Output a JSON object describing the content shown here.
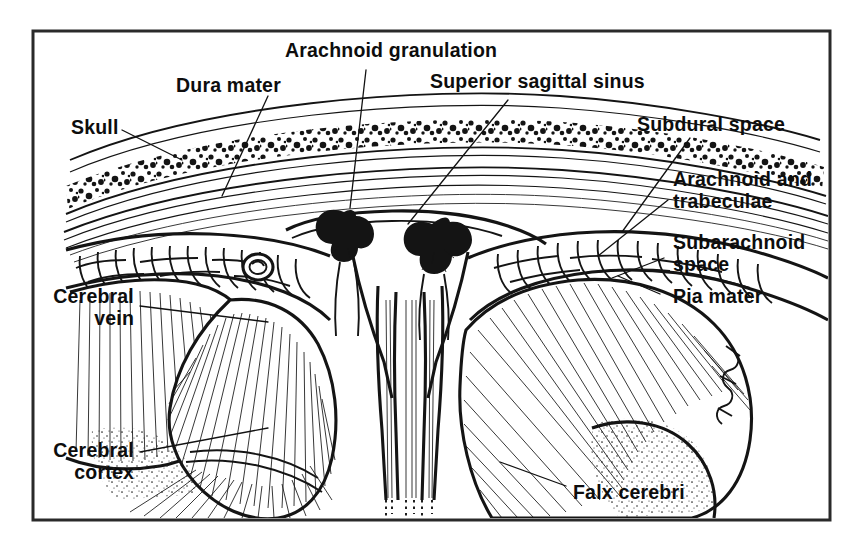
{
  "figure": {
    "type": "anatomical-line-diagram",
    "background_color": "#ffffff",
    "ink_color": "#141414",
    "frame_color": "#2a2a2a",
    "frame": {
      "x": 33,
      "y": 31,
      "width": 797,
      "height": 489
    }
  },
  "labels": {
    "arachnoid_granulation": "Arachnoid granulation",
    "superior_sagittal_sinus": "Superior sagittal sinus",
    "dura_mater": "Dura mater",
    "skull": "Skull",
    "subdural_space": "Subdural space",
    "arachnoid_and_trabeculae_line1": "Arachnoid and",
    "arachnoid_and_trabeculae_line2": "trabeculae",
    "subarachnoid_space_line1": "Subarachnoid",
    "subarachnoid_space_line2": "space",
    "pia_mater": "Pia mater",
    "cerebral_vein_line1": "Cerebral",
    "cerebral_vein_line2": "vein",
    "cerebral_cortex_line1": "Cerebral",
    "cerebral_cortex_line2": "cortex",
    "falx_cerebri": "Falx cerebri"
  },
  "structures": [
    {
      "name": "skull-outer-table",
      "description": "outer compact bone curve"
    },
    {
      "name": "skull-diploe",
      "description": "speckled cancellous bone marrow band"
    },
    {
      "name": "skull-inner-table",
      "description": "inner compact bone curve"
    },
    {
      "name": "dura-mater-layer",
      "description": "dense fibrous membrane beneath skull"
    },
    {
      "name": "subdural-space",
      "description": "potential space between dura and arachnoid"
    },
    {
      "name": "superior-sagittal-sinus",
      "description": "triangular venous channel at midline apex"
    },
    {
      "name": "arachnoid-granulation-left",
      "description": "villus protruding into sinus"
    },
    {
      "name": "arachnoid-granulation-right",
      "description": "villus protruding into sinus"
    },
    {
      "name": "subarachnoid-space",
      "description": "CSF-filled space crossed by trabeculae"
    },
    {
      "name": "pia-mater",
      "description": "membrane adherent to cortical surface"
    },
    {
      "name": "cerebral-cortex-left",
      "description": "left hemisphere gyri with radiating fibers"
    },
    {
      "name": "cerebral-cortex-right",
      "description": "right hemisphere gyri with radiating fibers"
    },
    {
      "name": "cerebral-vein",
      "description": "bridging vein cross-section, left side"
    },
    {
      "name": "falx-cerebri",
      "description": "midline dural fold descending between hemispheres"
    }
  ]
}
